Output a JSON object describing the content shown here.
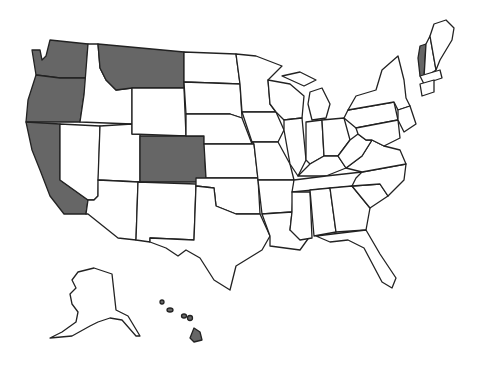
{
  "map": {
    "title": "United States",
    "shade_color": "#666666",
    "base_color": "#ffffff",
    "shaded_states": [
      "Washington",
      "Oregon",
      "California",
      "Montana",
      "Colorado",
      "Vermont",
      "Hawaii"
    ]
  }
}
